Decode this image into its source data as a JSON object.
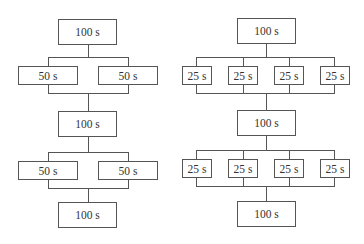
{
  "diagram": {
    "left_flow": {
      "top": "100 s",
      "stage1": [
        "50 s",
        "50 s"
      ],
      "middle": "100 s",
      "stage2": [
        "50 s",
        "50 s"
      ],
      "bottom": "100 s"
    },
    "right_flow": {
      "top": "100 s",
      "stage1": [
        "25 s",
        "25 s",
        "25 s",
        "25 s"
      ],
      "middle": "100 s",
      "stage2": [
        "25 s",
        "25 s",
        "25 s",
        "25 s"
      ],
      "bottom": "100 s"
    },
    "colors": {
      "line": "#555555",
      "text": "#333333",
      "background": "#ffffff"
    }
  }
}
